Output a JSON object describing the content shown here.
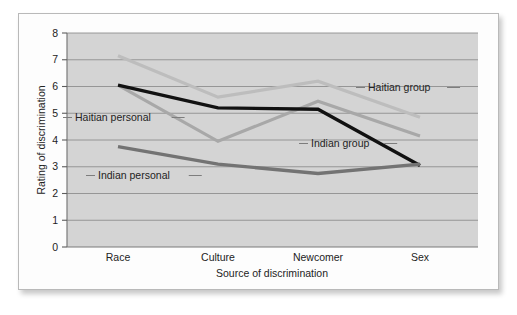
{
  "figure": {
    "background_color": "#ffffff",
    "card_background_color": "#fdfdfd",
    "card_border_color": "#b9b9b9"
  },
  "chart_data": {
    "type": "line",
    "title": "",
    "xlabel": "Source of discrimination",
    "ylabel": "Rating of discrimination",
    "categories": [
      "Race",
      "Culture",
      "Newcomer",
      "Sex"
    ],
    "ylim": [
      0,
      8
    ],
    "yticks": [
      0,
      1,
      2,
      3,
      4,
      5,
      6,
      7,
      8
    ],
    "ytick_labels": [
      "0",
      "1",
      "2",
      "3",
      "4",
      "5",
      "6",
      "7",
      "8"
    ],
    "grid": true,
    "grid_axis": "y",
    "legend": "inline-annotations",
    "plot_background_color": "#d4d4d4",
    "series": [
      {
        "name": "Haitian group",
        "color": "#bdbdbd",
        "width": 3.2,
        "values": [
          7.15,
          5.6,
          6.2,
          4.85
        ]
      },
      {
        "name": "Haitian personal",
        "color": "#a8a8a8",
        "width": 3.2,
        "values": [
          6.05,
          3.95,
          5.45,
          4.15
        ]
      },
      {
        "name": "Indian group",
        "color": "#111111",
        "width": 3.4,
        "values": [
          6.05,
          5.2,
          5.15,
          3.05
        ]
      },
      {
        "name": "Indian personal",
        "color": "#737373",
        "width": 3.4,
        "values": [
          3.75,
          3.1,
          2.75,
          3.1
        ]
      }
    ],
    "annotations": [
      {
        "text": "Haitian personal",
        "series": "Haitian personal",
        "x": 75,
        "y": 121,
        "anchor": "start",
        "leader_left": true,
        "leader_right": true
      },
      {
        "text": "Indian personal",
        "series": "Indian personal",
        "x": 98,
        "y": 179,
        "anchor": "start",
        "leader_left": true,
        "leader_right": true
      },
      {
        "text": "Indian group",
        "series": "Indian group",
        "x": 311,
        "y": 147,
        "anchor": "start",
        "leader_left": true,
        "leader_right": true
      },
      {
        "text": "Haitian group",
        "series": "Haitian group",
        "x": 368,
        "y": 91,
        "anchor": "start",
        "leader_left": true,
        "leader_right": true
      }
    ]
  }
}
